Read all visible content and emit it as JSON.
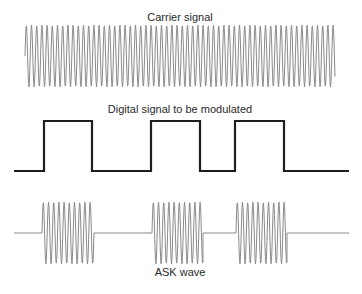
{
  "labels": {
    "carrier": "Carrier signal",
    "digital": "Digital signal to be modulated",
    "ask": "ASK wave"
  },
  "colors": {
    "carrier_stroke": "#8a8a8a",
    "digital_stroke": "#1e1e1e",
    "ask_stroke": "#8a8a8a",
    "text": "#2a2a2a"
  },
  "carrier": {
    "x_start": 25,
    "x_end": 335,
    "y_center": 56,
    "amplitude": 31,
    "period": 5.2
  },
  "digital": {
    "x_start": 14,
    "x_end": 349,
    "y_low": 171,
    "y_high": 121,
    "bits": [
      0,
      1,
      0,
      1,
      0,
      1,
      0
    ],
    "transitions": [
      44,
      92,
      151,
      200,
      235,
      284
    ]
  },
  "ask": {
    "x_start": 14,
    "x_end": 349,
    "y_center": 233,
    "amplitude": 31,
    "period": 5.2,
    "bursts": [
      [
        42,
        94
      ],
      [
        152,
        203
      ],
      [
        236,
        287
      ]
    ]
  }
}
